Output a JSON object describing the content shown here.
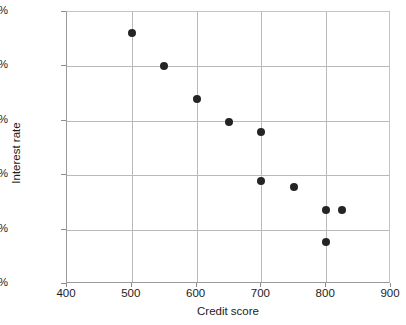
{
  "chart_data": {
    "type": "scatter",
    "title": "",
    "xlabel": "Credit score",
    "ylabel": "Interest rate",
    "xlim": [
      400,
      900
    ],
    "ylim": [
      5.0,
      7.5
    ],
    "xticks": [
      400,
      500,
      600,
      700,
      800,
      900
    ],
    "yticks": [
      5.0,
      5.5,
      6.0,
      6.5,
      7.0,
      7.5
    ],
    "xtick_labels": [
      "400",
      "500",
      "600",
      "700",
      "800",
      "900"
    ],
    "ytick_labels": [
      "5.00%",
      "5.50%",
      "6.00%",
      "6.50%",
      "7.00%",
      "7.50%"
    ],
    "grid": true,
    "legend": null,
    "marker": "filled-circle",
    "marker_color": "#242424",
    "grid_color": "#b9b9b9",
    "axis_color": "#9a9a9a",
    "points": [
      {
        "x": 500,
        "y": 7.31
      },
      {
        "x": 550,
        "y": 7.0
      },
      {
        "x": 600,
        "y": 6.7
      },
      {
        "x": 650,
        "y": 6.49
      },
      {
        "x": 700,
        "y": 6.4
      },
      {
        "x": 700,
        "y": 5.95
      },
      {
        "x": 750,
        "y": 5.89
      },
      {
        "x": 800,
        "y": 5.68
      },
      {
        "x": 825,
        "y": 5.68
      },
      {
        "x": 800,
        "y": 5.39
      }
    ]
  }
}
